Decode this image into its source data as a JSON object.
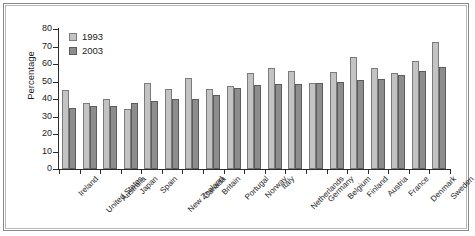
{
  "chart_data": {
    "type": "bar",
    "title": "",
    "xlabel": "",
    "ylabel": "Percentage",
    "ylim": [
      0,
      80
    ],
    "yticks": [
      0,
      10,
      20,
      30,
      40,
      50,
      60,
      70,
      80
    ],
    "grid": false,
    "legend_position": "top-left",
    "categories": [
      "Ireland",
      "United States",
      "Australia",
      "Japan",
      "Spain",
      "New Zealand",
      "Canada",
      "Britain",
      "Portugal",
      "Norway",
      "Italy",
      "Netherlands",
      "Germany",
      "Belgium",
      "Finland",
      "Austria",
      "France",
      "Denmark",
      "Sweden"
    ],
    "series": [
      {
        "name": "1993",
        "color": "#c3c3c3",
        "values": [
          45,
          37.5,
          40,
          34.5,
          49,
          46,
          52,
          45.5,
          47.5,
          55,
          57.5,
          56,
          49,
          55.5,
          64,
          57.5,
          55,
          61.5,
          72.5
        ]
      },
      {
        "name": "2003",
        "color": "#8d8d8d",
        "values": [
          35,
          36,
          36,
          38,
          39,
          40,
          40,
          42.5,
          46.5,
          48,
          48.5,
          48.5,
          49,
          49.5,
          51,
          51.5,
          54,
          56,
          58.5
        ]
      }
    ]
  },
  "legend": {
    "items": [
      {
        "label": "1993"
      },
      {
        "label": "2003"
      }
    ]
  }
}
